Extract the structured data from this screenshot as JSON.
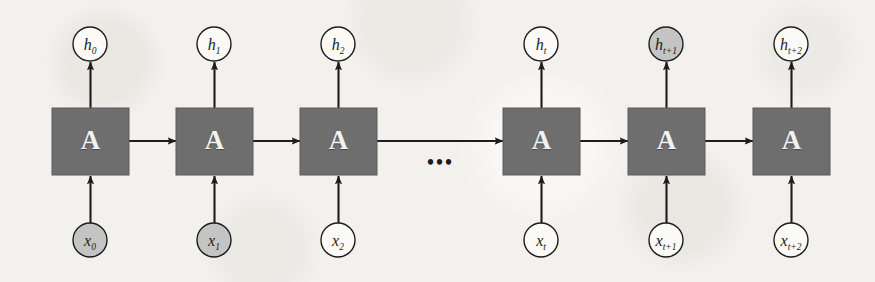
{
  "figure": {
    "background_color": "#f3f1ed",
    "cell_fill": "#6e6e6e",
    "cell_stroke": "#5b5b5b",
    "cell_text_color": "#f2f2f2",
    "circle_white_fill": "#fbfaf7",
    "circle_shaded_fill": "#c4c4c4",
    "stroke_color": "#1d1d1d",
    "ellipsis": "•••"
  },
  "cells": [
    {
      "id": "cell-0",
      "label": "A",
      "x": 52,
      "y": 108,
      "w": 77,
      "h": 67
    },
    {
      "id": "cell-1",
      "label": "A",
      "x": 176,
      "y": 108,
      "w": 77,
      "h": 67
    },
    {
      "id": "cell-2",
      "label": "A",
      "x": 300,
      "y": 108,
      "w": 77,
      "h": 67
    },
    {
      "id": "cell-3",
      "label": "A",
      "x": 503,
      "y": 108,
      "w": 77,
      "h": 67
    },
    {
      "id": "cell-4",
      "label": "A",
      "x": 628,
      "y": 108,
      "w": 77,
      "h": 67
    },
    {
      "id": "cell-5",
      "label": "A",
      "x": 753,
      "y": 108,
      "w": 77,
      "h": 67
    }
  ],
  "outputs": [
    {
      "id": "h0",
      "base": "h",
      "sub": "0",
      "cx": 90,
      "cy": 44,
      "r": 17,
      "shaded": false
    },
    {
      "id": "h1",
      "base": "h",
      "sub": "1",
      "cx": 214,
      "cy": 44,
      "r": 17,
      "shaded": false
    },
    {
      "id": "h2",
      "base": "h",
      "sub": "2",
      "cx": 338,
      "cy": 44,
      "r": 17,
      "shaded": false
    },
    {
      "id": "ht",
      "base": "h",
      "sub": "t",
      "cx": 541,
      "cy": 44,
      "r": 17,
      "shaded": false
    },
    {
      "id": "ht1",
      "base": "h",
      "sub": "t+1",
      "cx": 666,
      "cy": 44,
      "r": 17,
      "shaded": true
    },
    {
      "id": "ht2",
      "base": "h",
      "sub": "t+2",
      "cx": 791,
      "cy": 44,
      "r": 17,
      "shaded": false
    }
  ],
  "inputs": [
    {
      "id": "x0",
      "base": "x",
      "sub": "0",
      "cx": 90,
      "cy": 240,
      "r": 17,
      "shaded": true
    },
    {
      "id": "x1",
      "base": "x",
      "sub": "1",
      "cx": 214,
      "cy": 240,
      "r": 17,
      "shaded": true
    },
    {
      "id": "x2",
      "base": "x",
      "sub": "2",
      "cx": 338,
      "cy": 240,
      "r": 17,
      "shaded": false
    },
    {
      "id": "xt",
      "base": "x",
      "sub": "t",
      "cx": 541,
      "cy": 240,
      "r": 17,
      "shaded": false
    },
    {
      "id": "xt1",
      "base": "x",
      "sub": "t+1",
      "cx": 666,
      "cy": 240,
      "r": 17,
      "shaded": false
    },
    {
      "id": "xt2",
      "base": "x",
      "sub": "t+2",
      "cx": 791,
      "cy": 240,
      "r": 17,
      "shaded": false
    }
  ],
  "horizontal_arrows": [
    {
      "id": "arrow-0-1",
      "x1": 129,
      "x2": 176,
      "y": 141
    },
    {
      "id": "arrow-1-2",
      "x1": 253,
      "x2": 300,
      "y": 141
    },
    {
      "id": "arrow-2-3",
      "x1": 377,
      "x2": 503,
      "y": 141
    },
    {
      "id": "arrow-3-4",
      "x1": 580,
      "x2": 628,
      "y": 141
    },
    {
      "id": "arrow-4-5",
      "x1": 705,
      "x2": 753,
      "y": 141
    }
  ],
  "ellipsis_marker": {
    "text": "•••",
    "x": 427,
    "y": 152
  }
}
